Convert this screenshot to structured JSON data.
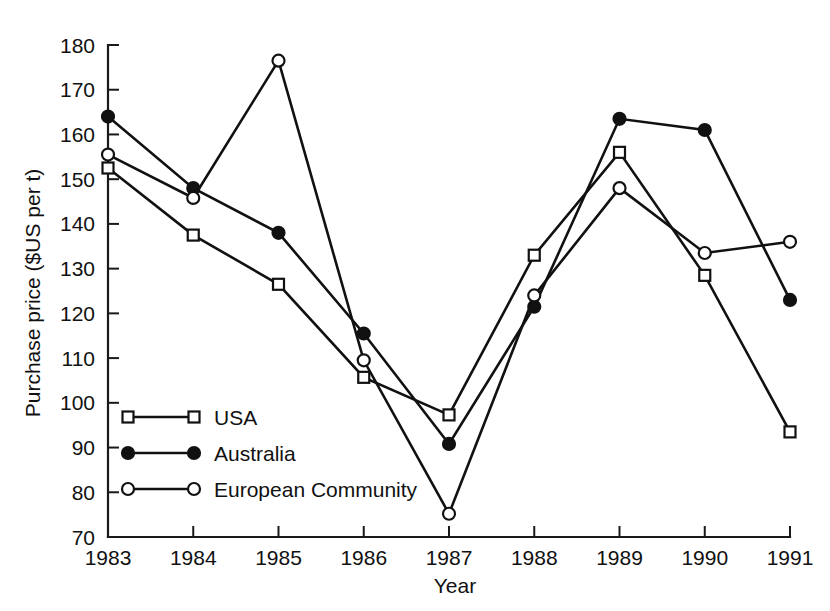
{
  "chart_data": {
    "type": "line",
    "title": "",
    "xlabel": "Year",
    "ylabel": "Purchase price ($US per t)",
    "categories": [
      "1983",
      "1984",
      "1985",
      "1986",
      "1987",
      "1988",
      "1989",
      "1990",
      "1991"
    ],
    "x": [
      1983,
      1984,
      1985,
      1986,
      1987,
      1988,
      1989,
      1990,
      1991
    ],
    "xlim": [
      1983,
      1991
    ],
    "ylim": [
      70,
      180
    ],
    "ytick_step": 10,
    "yticks": [
      70,
      80,
      90,
      100,
      110,
      120,
      130,
      140,
      150,
      160,
      170,
      180
    ],
    "grid": false,
    "legend_position": "inside-lower-left",
    "series": [
      {
        "name": "USA",
        "marker": "open-square",
        "values": [
          152.5,
          137.5,
          126.5,
          105.7,
          97.3,
          133.0,
          156.0,
          128.5,
          93.5
        ]
      },
      {
        "name": "Australia",
        "marker": "filled-circle",
        "values": [
          164.0,
          148.0,
          138.0,
          115.5,
          90.8,
          121.5,
          163.5,
          161.0,
          123.0
        ]
      },
      {
        "name": "European Community",
        "marker": "open-circle",
        "values": [
          155.5,
          145.8,
          176.5,
          109.5,
          75.2,
          124.0,
          148.0,
          133.5,
          136.0
        ]
      }
    ]
  },
  "axes": {
    "y_title": "Purchase price ($US per t)",
    "x_title": "Year"
  },
  "legend": {
    "items": [
      {
        "label": "USA",
        "marker": "open-square"
      },
      {
        "label": "Australia",
        "marker": "filled-circle"
      },
      {
        "label": "European Community",
        "marker": "open-circle"
      }
    ]
  },
  "colors": {
    "ink": "#111111",
    "background": "#ffffff"
  }
}
